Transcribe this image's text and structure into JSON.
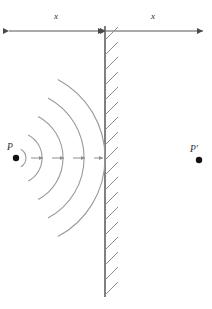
{
  "figure": {
    "type": "optics-ray-diagram",
    "background_color": "#ffffff"
  },
  "dimension_axis": {
    "name": "distance-axis",
    "y": 31,
    "left_end_x": 8,
    "right_end_x": 204,
    "center_x": 105,
    "line_color": "#555555",
    "segments": [
      {
        "id": "left",
        "label": "x",
        "label_x": 56,
        "label_y": 19
      },
      {
        "id": "right",
        "label": "x",
        "label_x": 153,
        "label_y": 19
      }
    ]
  },
  "mirror": {
    "name": "mirror-wall",
    "x": 105,
    "top_y": 26,
    "bottom_y": 297,
    "line_color": "#4a4a4a",
    "hatch_color": "#8d8d8d",
    "hatch_count": 18,
    "hatch_length": 17,
    "hatch_angle_deg": -40
  },
  "source_point": {
    "name": "point-source-p",
    "label": "P",
    "x": 16,
    "y": 158,
    "label_x": 10,
    "label_y": 150,
    "dot_radius": 3.2,
    "color": "#111111"
  },
  "image_point": {
    "name": "virtual-image-p-prime",
    "label": "P′",
    "x": 199,
    "y": 160,
    "label_x": 192,
    "label_y": 152,
    "dot_radius": 3.2,
    "color": "#111111"
  },
  "wavefronts": {
    "name": "wavefront-arcs",
    "center_x": 16,
    "center_y": 158,
    "color": "#9a9a9a",
    "stroke_width": 1.1,
    "radii": [
      10,
      26,
      47,
      68,
      89
    ],
    "angular_half_extent_deg": 62
  },
  "propagation_arrows": {
    "name": "propagation-arrows",
    "y": 158,
    "color": "#8f8f8f",
    "positions": [
      {
        "x1": 31,
        "x2": 43
      },
      {
        "x1": 52,
        "x2": 64
      },
      {
        "x1": 73,
        "x2": 85
      },
      {
        "x1": 94,
        "x2": 104
      }
    ]
  }
}
